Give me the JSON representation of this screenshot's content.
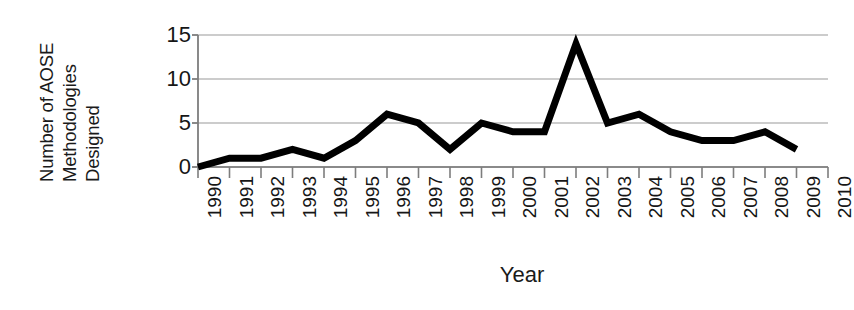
{
  "chart_data": {
    "type": "line",
    "title": "",
    "xlabel": "Year",
    "ylabel": "Number of AOSE Methodologies Designed",
    "ylabel_lines": [
      "Number of AOSE",
      "Methodologies",
      "Designed"
    ],
    "x": [
      1990,
      1991,
      1992,
      1993,
      1994,
      1995,
      1996,
      1997,
      1998,
      1999,
      2000,
      2001,
      2002,
      2003,
      2004,
      2005,
      2006,
      2007,
      2008,
      2009
    ],
    "values": [
      0,
      1,
      1,
      2,
      1,
      3,
      6,
      5,
      2,
      5,
      4,
      4,
      14,
      5,
      6,
      4,
      3,
      3,
      4,
      2
    ],
    "series": [
      {
        "name": "AOSE methodologies designed",
        "values": [
          0,
          1,
          1,
          2,
          1,
          3,
          6,
          5,
          2,
          5,
          4,
          4,
          14,
          5,
          6,
          4,
          3,
          3,
          4,
          2
        ]
      }
    ],
    "xlim": [
      1990,
      2010
    ],
    "ylim": [
      0,
      15
    ],
    "xticks": [
      1990,
      1991,
      1992,
      1993,
      1994,
      1995,
      1996,
      1997,
      1998,
      1999,
      2000,
      2001,
      2002,
      2003,
      2004,
      2005,
      2006,
      2007,
      2008,
      2009,
      2010
    ],
    "xtick_labels": [
      "1990",
      "1991",
      "1992",
      "1993",
      "1994",
      "1995",
      "1996",
      "1997",
      "1998",
      "1999",
      "2000",
      "2001",
      "2002",
      "2003",
      "2004",
      "2005",
      "2006",
      "2007",
      "2008",
      "2009",
      "2010"
    ],
    "yticks": [
      0,
      5,
      10,
      15
    ],
    "ytick_labels": [
      "0",
      "5",
      "10",
      "15"
    ],
    "grid": "horizontal",
    "legend": "none",
    "line_color": "#000000",
    "line_width": 7,
    "grid_color": "#9a9a9a",
    "axis_color": "#7d7d7d",
    "background": "#ffffff"
  },
  "axis": {
    "x_title": "Year"
  }
}
